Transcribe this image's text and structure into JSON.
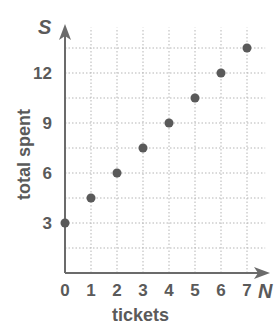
{
  "chart_data": {
    "type": "scatter",
    "title": "",
    "xlabel": "tickets",
    "ylabel": "total spent",
    "x_axis_variable": "N",
    "y_axis_variable": "S",
    "x_ticks": [
      "0",
      "1",
      "2",
      "3",
      "4",
      "5",
      "6",
      "7"
    ],
    "y_ticks": [
      "3",
      "6",
      "9",
      "12"
    ],
    "xlim": [
      0,
      7.7
    ],
    "ylim": [
      0,
      14
    ],
    "grid": true,
    "grid_style": "dotted",
    "y_grid_step": 1.5,
    "x_grid_step": 1,
    "legend": null,
    "series": [
      {
        "name": "total spent vs tickets",
        "x": [
          0,
          1,
          2,
          3,
          4,
          5,
          6,
          7
        ],
        "y": [
          3,
          4.5,
          6,
          7.5,
          9,
          10.5,
          12,
          13.5
        ]
      }
    ],
    "colors": {
      "axis": "#6b6b6b",
      "grid": "#b5b5b5",
      "point": "#5a5a5a",
      "text": "#5a5a5a"
    }
  },
  "labels": {
    "xlabel": "tickets",
    "ylabel": "total spent",
    "x_var": "N",
    "y_var": "S"
  }
}
